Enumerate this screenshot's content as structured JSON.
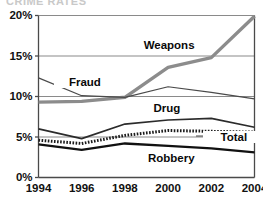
{
  "title_fragment": "CRIME RATES",
  "chart_data": {
    "type": "line",
    "title": "",
    "subtitle": "",
    "xlabel": "",
    "ylabel": "",
    "x": [
      1994,
      1996,
      1998,
      2000,
      2002,
      2004
    ],
    "categories": [
      "1994",
      "1996",
      "1998",
      "2000",
      "2002",
      "2004"
    ],
    "xtick_labels": [
      "1994",
      "1996",
      "1998",
      "2000",
      "2002",
      "2004"
    ],
    "ytick_labels": [
      "0%",
      "5%",
      "10%",
      "15%",
      "20%"
    ],
    "ytick_values": [
      0,
      5,
      10,
      15,
      20
    ],
    "ylim": [
      0,
      20
    ],
    "xlim": [
      1994,
      2004
    ],
    "grid": true,
    "grid_axis": "y",
    "legend": "none",
    "legend_position": "inline-annotations",
    "series": [
      {
        "name": "Weapons",
        "label": "Weapons",
        "color": "#8c8c8c",
        "style": "thick-gray",
        "values": [
          9.3,
          9.4,
          9.9,
          13.6,
          14.8,
          19.9
        ]
      },
      {
        "name": "Fraud",
        "label": "Fraud",
        "color": "#4a4a4a",
        "style": "thin-solid",
        "values": [
          12.3,
          10.1,
          9.9,
          11.2,
          10.5,
          9.7
        ]
      },
      {
        "name": "Drug",
        "label": "Drug",
        "color": "#2b2b2b",
        "style": "medium-solid",
        "values": [
          6.0,
          4.8,
          6.6,
          7.1,
          7.3,
          6.2
        ]
      },
      {
        "name": "Total",
        "label": "Total",
        "color": "#1a1a1a",
        "style": "dotted-thick",
        "values": [
          4.6,
          4.2,
          5.2,
          5.8,
          5.7,
          5.6
        ]
      },
      {
        "name": "Robbery",
        "label": "Robbery",
        "color": "#111111",
        "style": "thick-black",
        "values": [
          4.1,
          3.4,
          4.2,
          3.9,
          3.6,
          3.1
        ]
      }
    ],
    "annotations": [
      {
        "text": "Weapons",
        "x": 2000,
        "y": 16.2
      },
      {
        "text": "Fraud",
        "x": 1996,
        "y": 11.8
      },
      {
        "text": "Drug",
        "x": 2000,
        "y": 8.5
      },
      {
        "text": "Total",
        "x": 2003,
        "y": 4.9
      },
      {
        "text": "Robbery",
        "x": 2000,
        "y": 2.3
      }
    ]
  },
  "axes": {
    "y_labels": [
      {
        "text": "20%",
        "value": 20
      },
      {
        "text": "15%",
        "value": 15
      },
      {
        "text": "10%",
        "value": 10
      },
      {
        "text": "5%",
        "value": 5
      },
      {
        "text": "0%",
        "value": 0
      }
    ],
    "x_labels": [
      {
        "text": "1994",
        "value": 1994
      },
      {
        "text": "1996",
        "value": 1996
      },
      {
        "text": "1998",
        "value": 1998
      },
      {
        "text": "2000",
        "value": 2000
      },
      {
        "text": "2002",
        "value": 2002
      },
      {
        "text": "2004",
        "value": 2004
      }
    ]
  },
  "labels": {
    "weapons": "Weapons",
    "fraud": "Fraud",
    "drug": "Drug",
    "total": "Total",
    "robbery": "Robbery"
  },
  "colors": {
    "weapons": "#8c8c8c",
    "fraud": "#4a4a4a",
    "drug": "#2b2b2b",
    "total": "#1a1a1a",
    "robbery": "#111111",
    "axis": "#4a4a4a",
    "grid": "#8a8a8a",
    "background": "#ffffff",
    "text": "#0a0a0a"
  }
}
